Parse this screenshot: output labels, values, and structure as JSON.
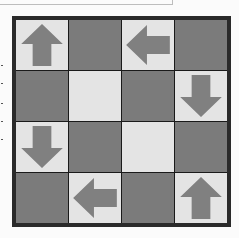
{
  "puzzle": {
    "rows": 4,
    "cols": 4,
    "colors": {
      "dark": "#7b7b7b",
      "light": "#e4e4e4",
      "arrow": "#808080",
      "border": "#2a2a2a"
    },
    "cells": [
      [
        {
          "shade": "light",
          "icon": "arrow-up"
        },
        {
          "shade": "dark",
          "icon": "none"
        },
        {
          "shade": "light",
          "icon": "arrow-left"
        },
        {
          "shade": "dark",
          "icon": "none"
        }
      ],
      [
        {
          "shade": "dark",
          "icon": "none"
        },
        {
          "shade": "light",
          "icon": "none"
        },
        {
          "shade": "dark",
          "icon": "none"
        },
        {
          "shade": "light",
          "icon": "arrow-down"
        }
      ],
      [
        {
          "shade": "light",
          "icon": "arrow-down"
        },
        {
          "shade": "dark",
          "icon": "none"
        },
        {
          "shade": "light",
          "icon": "none"
        },
        {
          "shade": "dark",
          "icon": "none"
        }
      ],
      [
        {
          "shade": "dark",
          "icon": "none"
        },
        {
          "shade": "light",
          "icon": "arrow-left"
        },
        {
          "shade": "dark",
          "icon": "none"
        },
        {
          "shade": "light",
          "icon": "arrow-up"
        }
      ]
    ]
  }
}
